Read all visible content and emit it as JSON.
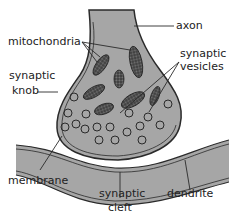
{
  "diagram": {
    "colors": {
      "background": "#ffffff",
      "fill": "#a6a6a6",
      "outline": "#2a2a2a",
      "mitochondria": "#4a4a4a",
      "text": "#222222"
    },
    "labels": {
      "axon": "axon",
      "mitochondria": "mitochondria",
      "synaptic_vesicles_line1": "synaptic",
      "synaptic_vesicles_line2": "vesicles",
      "synaptic_knob_line1": "synaptic",
      "synaptic_knob_line2": "knob",
      "membrane": "membrane",
      "synaptic_cleft_line1": "synaptic",
      "synaptic_cleft_line2": "cleft",
      "dendrite": "dendrite"
    },
    "structures": [
      "axon",
      "synaptic knob",
      "mitochondria",
      "synaptic vesicles",
      "membrane",
      "synaptic cleft",
      "dendrite"
    ]
  }
}
